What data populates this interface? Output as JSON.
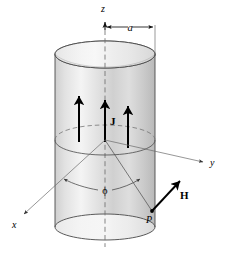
{
  "figure": {
    "background_color": "#ffffff",
    "width": 225,
    "height": 254
  },
  "colors": {
    "ink": "#000000",
    "thin_line": "#555555",
    "cylinder_outline": "#3a3a3a",
    "cylinder_fill_light": "#f2f2f2",
    "cylinder_fill_mid": "#d6d6d6",
    "cylinder_fill_dark": "#bdbdbd",
    "dashed_line": "#777777"
  },
  "axes": [
    {
      "id": "z",
      "label": "z",
      "label_x": 103,
      "label_y": 12,
      "italic": true
    },
    {
      "id": "x",
      "label": "x",
      "label_x": 12,
      "label_y": 228,
      "italic": true
    },
    {
      "id": "y",
      "label": "y",
      "label_x": 212,
      "label_y": 165,
      "italic": true
    }
  ],
  "dimension": {
    "label": "a",
    "label_x": 122,
    "label_y": 24,
    "description": "radius of the cylinder measured from the z axis to the cylinder surface"
  },
  "current_density": {
    "label": "J",
    "label_x": 107,
    "label_y": 124,
    "bold": true,
    "arrow_count": 3,
    "direction": "up (+z)"
  },
  "field_vector": {
    "label": "H",
    "label_x": 182,
    "label_y": 196,
    "bold": true,
    "direction": "up-right, tangential"
  },
  "point": {
    "label": "P",
    "label_x": 158,
    "label_y": 222,
    "italic": true
  },
  "angle": {
    "label": "ϕ",
    "label_x": 104,
    "label_y": 192,
    "description": "azimuthal angle measured in the x-y plane from the x axis to the radial line toward P"
  },
  "geometry": {
    "origin": {
      "x": 105,
      "y": 140
    },
    "cylinder": {
      "center_x": 105,
      "left_x": 55,
      "right_x": 155,
      "top_y": 43,
      "bottom_y": 238,
      "ellipse_ry": 13
    }
  }
}
